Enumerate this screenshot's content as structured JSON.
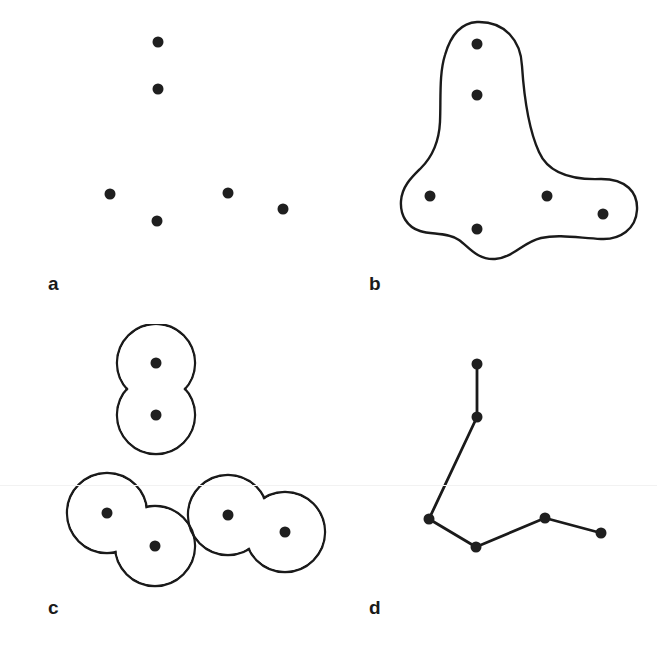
{
  "figure": {
    "width": 657,
    "height": 647,
    "background_color": "#ffffff",
    "ink_color": "#1a1a1a",
    "dot_color": "#1f1f1f",
    "dot_radius": 5.5,
    "stroke_width": 2.4
  },
  "panels": [
    {
      "id": "a",
      "label": "a",
      "label_position": {
        "x": 48,
        "y": 274
      },
      "content_type": "scatter-points",
      "points": [
        {
          "x": 158,
          "y": 42
        },
        {
          "x": 158,
          "y": 89
        },
        {
          "x": 110,
          "y": 194
        },
        {
          "x": 157,
          "y": 221
        },
        {
          "x": 228,
          "y": 193
        },
        {
          "x": 283,
          "y": 209
        }
      ],
      "shapes": [],
      "edges": []
    },
    {
      "id": "b",
      "label": "b",
      "label_position": {
        "x": 40,
        "y": 274
      },
      "content_type": "enclosing-contour",
      "points": [
        {
          "x": 148,
          "y": 44
        },
        {
          "x": 148,
          "y": 95
        },
        {
          "x": 101,
          "y": 196
        },
        {
          "x": 148,
          "y": 229
        },
        {
          "x": 218,
          "y": 196
        },
        {
          "x": 274,
          "y": 214
        }
      ],
      "contour_path": "M 148 22 C 176 21 192 41 193 66 C 195 96 199 128 210 152 C 220 175 246 180 272 179 C 297 179 309 192 308 210 C 307 229 291 240 272 239 C 250 238 230 234 212 238 C 194 242 184 258 166 259 C 148 260 140 247 130 240 C 118 232 103 235 91 231 C 78 227 71 215 72 201 C 73 186 83 177 92 168 C 103 157 110 142 111 122 C 112 98 110 74 116 55 C 122 34 132 23 148 22 Z",
      "edges": []
    },
    {
      "id": "c",
      "label": "c",
      "label_position": {
        "x": 48,
        "y": 274
      },
      "content_type": "pair-clusters",
      "points": [
        {
          "x": 156,
          "y": 39
        },
        {
          "x": 156,
          "y": 91
        },
        {
          "x": 107,
          "y": 189
        },
        {
          "x": 155,
          "y": 222
        },
        {
          "x": 228,
          "y": 191
        },
        {
          "x": 285,
          "y": 208
        }
      ],
      "circles": [
        {
          "cx": 156,
          "cy": 39,
          "r": 39,
          "group": 1
        },
        {
          "cx": 156,
          "cy": 91,
          "r": 39,
          "group": 1
        },
        {
          "cx": 107,
          "cy": 189,
          "r": 40,
          "group": 2
        },
        {
          "cx": 155,
          "cy": 222,
          "r": 40,
          "group": 2
        },
        {
          "cx": 228,
          "cy": 191,
          "r": 40,
          "group": 3
        },
        {
          "cx": 285,
          "cy": 208,
          "r": 40,
          "group": 3
        }
      ],
      "edges": []
    },
    {
      "id": "d",
      "label": "d",
      "label_position": {
        "x": 40,
        "y": 274
      },
      "content_type": "minimum-spanning-tree",
      "points": [
        {
          "id": 0,
          "x": 148,
          "y": 40
        },
        {
          "id": 1,
          "x": 148,
          "y": 93
        },
        {
          "id": 2,
          "x": 100,
          "y": 195
        },
        {
          "id": 3,
          "x": 147,
          "y": 223
        },
        {
          "id": 4,
          "x": 216,
          "y": 194
        },
        {
          "id": 5,
          "x": 272,
          "y": 209
        }
      ],
      "edges": [
        {
          "from": 0,
          "to": 1
        },
        {
          "from": 1,
          "to": 2
        },
        {
          "from": 2,
          "to": 3
        },
        {
          "from": 3,
          "to": 4
        },
        {
          "from": 4,
          "to": 5
        }
      ],
      "shapes": []
    }
  ]
}
